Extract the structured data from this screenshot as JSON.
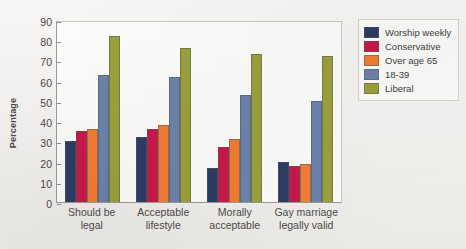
{
  "chart_data": {
    "type": "bar",
    "title": "",
    "xlabel": "",
    "ylabel": "Percentage",
    "ylim": [
      0,
      90
    ],
    "yticks": [
      0,
      10,
      20,
      30,
      40,
      50,
      60,
      70,
      80,
      90
    ],
    "grid": false,
    "legend_position": "right",
    "categories": [
      "Should be legal",
      "Acceptable lifestyle",
      "Morally acceptable",
      "Gay marriage legally valid"
    ],
    "category_lines": [
      [
        "Should be",
        "legal"
      ],
      [
        "Acceptable",
        "lifestyle"
      ],
      [
        "Morally",
        "acceptable"
      ],
      [
        "Gay marriage",
        "legally valid"
      ]
    ],
    "series": [
      {
        "name": "Worship weekly",
        "color": "#2d3c64",
        "values": [
          30,
          32,
          17,
          20
        ]
      },
      {
        "name": "Conservative",
        "color": "#c9174b",
        "values": [
          35,
          36,
          27,
          18
        ]
      },
      {
        "name": "Over age 65",
        "color": "#f07d34",
        "values": [
          36,
          38,
          31,
          19
        ]
      },
      {
        "name": "18-39",
        "color": "#6b82ab",
        "values": [
          63,
          62,
          53,
          50
        ]
      },
      {
        "name": "Liberal",
        "color": "#9aa03a",
        "values": [
          82,
          76,
          73,
          72
        ]
      }
    ]
  }
}
